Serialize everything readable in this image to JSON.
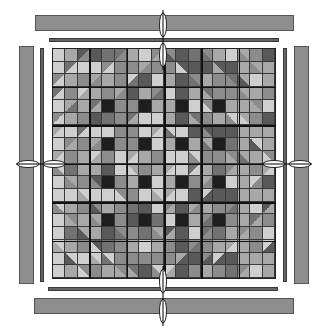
{
  "diagram": {
    "type": "quilt-layout",
    "grid_rows": 18,
    "grid_cols": 18,
    "block_size": 3,
    "colors": {
      "background": "#ffffff",
      "border_bar": "#8e8e8e",
      "inner_strip": "#666666",
      "dark_square": "#1e1e1e",
      "light": "#cfcfcf",
      "mid_light": "#a8a8a8",
      "mid": "#8c8c8c",
      "mid_dark": "#727272",
      "dark": "#595959"
    },
    "dark_square_positions": [
      [
        4,
        4
      ],
      [
        4,
        7
      ],
      [
        4,
        10
      ],
      [
        4,
        13
      ],
      [
        7,
        4
      ],
      [
        7,
        7
      ],
      [
        7,
        10
      ],
      [
        7,
        13
      ],
      [
        10,
        4
      ],
      [
        10,
        7
      ],
      [
        10,
        10
      ],
      [
        10,
        13
      ],
      [
        13,
        4
      ],
      [
        13,
        7
      ],
      [
        13,
        10
      ],
      [
        13,
        13
      ]
    ],
    "borders": {
      "top_outer": {
        "x": 35,
        "y": 15,
        "w": 259,
        "h": 16
      },
      "top_inner": {
        "x": 49,
        "y": 38,
        "w": 230,
        "h": 4
      },
      "bottom_inner": {
        "x": 48,
        "y": 287,
        "w": 230,
        "h": 4
      },
      "bottom_outer": {
        "x": 34,
        "y": 298,
        "w": 260,
        "h": 16
      },
      "left_outer": {
        "x": 19,
        "y": 46,
        "w": 15,
        "h": 238
      },
      "left_inner": {
        "x": 40,
        "y": 48,
        "w": 4,
        "h": 234
      },
      "right_inner": {
        "x": 283,
        "y": 48,
        "w": 4,
        "h": 234
      },
      "right_outer": {
        "x": 294,
        "y": 46,
        "w": 15,
        "h": 238
      }
    },
    "center_markers": [
      "top",
      "bottom",
      "left",
      "right"
    ]
  }
}
